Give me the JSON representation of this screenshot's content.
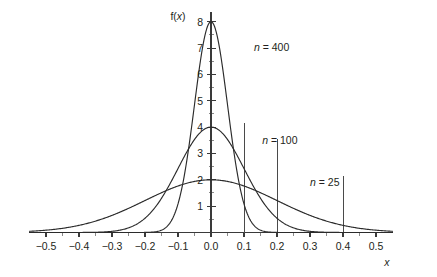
{
  "chart_data": {
    "type": "line",
    "title": "",
    "subtitle": "",
    "xlabel": "x",
    "ylabel": "f(x)",
    "xlim": [
      -0.55,
      0.55
    ],
    "ylim": [
      0,
      8.35
    ],
    "grid": false,
    "legend_position": "inline-annotations",
    "x_ticks": [
      -0.5,
      -0.4,
      -0.3,
      -0.2,
      -0.1,
      0.0,
      0.1,
      0.2,
      0.3,
      0.4,
      0.5
    ],
    "x_tick_labels": [
      "-0.5",
      "-0.4",
      "-0.3",
      "-0.2",
      "-0.1",
      "0.0",
      "0.1",
      "0.2",
      "0.3",
      "0.4",
      "0.5"
    ],
    "x_minor_tick_step": 0.05,
    "y_ticks": [
      1,
      2,
      3,
      4,
      5,
      6,
      7,
      8
    ],
    "y_tick_labels": [
      "1",
      "2",
      "3",
      "4",
      "5",
      "6",
      "7",
      "8"
    ],
    "y_minor_tick_step": 0.5,
    "series": [
      {
        "name": "n = 400",
        "label": "n = 400",
        "label_italic_prefix": "n",
        "label_rest": " = 400",
        "distribution": "normal",
        "mean": 0.0,
        "sigma": 0.05,
        "peak_value": 8.0,
        "label_x": 0.13,
        "label_y": 6.9
      },
      {
        "name": "n = 100",
        "label": "n = 100",
        "label_italic_prefix": "n",
        "label_rest": " = 100",
        "distribution": "normal",
        "mean": 0.0,
        "sigma": 0.1,
        "peak_value": 4.0,
        "label_x": 0.155,
        "label_y": 3.35
      },
      {
        "name": "n = 25",
        "label": "n = 25",
        "label_italic_prefix": "n",
        "label_rest": " = 25",
        "distribution": "normal",
        "mean": 0.0,
        "sigma": 0.2,
        "peak_value": 2.0,
        "label_x": 0.3,
        "label_y": 1.78
      }
    ],
    "reference_lines": [
      {
        "x": 0.1,
        "y_top": 4.15,
        "orientation": "vertical"
      },
      {
        "x": 0.2,
        "y_top": 3.55,
        "orientation": "vertical"
      },
      {
        "x": 0.4,
        "y_top": 2.15,
        "orientation": "vertical"
      }
    ],
    "colors": {
      "background": "#ffffff",
      "curve": "#2b2b2b",
      "axis": "#3a3a3a",
      "text": "#231f20",
      "reference_line": "#4a4a4a"
    }
  }
}
